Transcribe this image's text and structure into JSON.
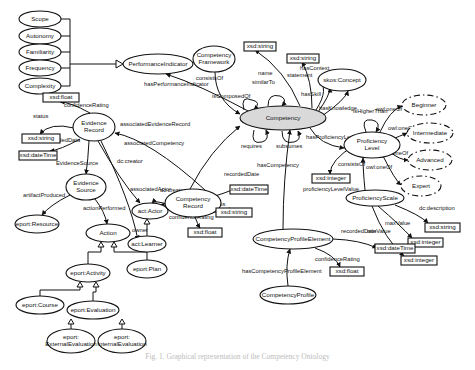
{
  "caption": "Fig. 1. Graphical representation of the Competency Ontology",
  "nodes": [
    {
      "id": "scope",
      "label": "Scope",
      "shape": "ellipse",
      "x": 40,
      "y": 19,
      "rx": 21,
      "ry": 8
    },
    {
      "id": "autonomy",
      "label": "Autonomy",
      "shape": "ellipse",
      "x": 40,
      "y": 36,
      "rx": 21,
      "ry": 8
    },
    {
      "id": "familiarity",
      "label": "Familiarity",
      "shape": "ellipse",
      "x": 40,
      "y": 52,
      "rx": 21,
      "ry": 8
    },
    {
      "id": "frequency",
      "label": "Frequency",
      "shape": "ellipse",
      "x": 40,
      "y": 68,
      "rx": 21,
      "ry": 8
    },
    {
      "id": "complexity",
      "label": "Complexity",
      "shape": "ellipse",
      "x": 40,
      "y": 86,
      "rx": 21,
      "ry": 8
    },
    {
      "id": "perfind",
      "label": "PerformanceIndicator",
      "shape": "ellipse",
      "x": 158,
      "y": 64,
      "rx": 35,
      "ry": 10
    },
    {
      "id": "compframe",
      "label": "Competency|Framework",
      "shape": "ellipse",
      "x": 214,
      "y": 59,
      "rx": 21,
      "ry": 13
    },
    {
      "id": "xsdstr1",
      "label": "xsd:string",
      "shape": "rect",
      "x": 244,
      "y": 42,
      "w": 32,
      "h": 9
    },
    {
      "id": "xsdstr2",
      "label": "xsd:string",
      "shape": "rect",
      "x": 287,
      "y": 54,
      "w": 32,
      "h": 9
    },
    {
      "id": "skos",
      "label": "skos:Concept",
      "shape": "ellipse",
      "x": 342,
      "y": 80,
      "rx": 24,
      "ry": 11
    },
    {
      "id": "competency",
      "label": "Competency",
      "shape": "main",
      "x": 283,
      "y": 118,
      "rx": 43,
      "ry": 12
    },
    {
      "id": "xsdfloat1",
      "label": "xsd:float",
      "shape": "rect",
      "x": 43,
      "y": 93,
      "w": 36,
      "h": 9
    },
    {
      "id": "evrec",
      "label": "Evidence|Record",
      "shape": "ellipse",
      "x": 94,
      "y": 127,
      "rx": 21,
      "ry": 14
    },
    {
      "id": "xsdstr3",
      "label": "xsd:string",
      "shape": "rect",
      "x": 22,
      "y": 134,
      "w": 38,
      "h": 9
    },
    {
      "id": "xsddt1",
      "label": "xsd:dateTime",
      "shape": "rect",
      "x": 19,
      "y": 151,
      "w": 38,
      "h": 9
    },
    {
      "id": "evsrc",
      "label": "Evidence|Source",
      "shape": "ellipse",
      "x": 86,
      "y": 187,
      "rx": 20,
      "ry": 13
    },
    {
      "id": "eportres",
      "label": "eport:Resource",
      "shape": "ellipse",
      "x": 37,
      "y": 224,
      "rx": 22,
      "ry": 9
    },
    {
      "id": "action",
      "label": "Action",
      "shape": "ellipse",
      "x": 108,
      "y": 233,
      "rx": 22,
      "ry": 9
    },
    {
      "id": "actactor",
      "label": "act:Actor",
      "shape": "ellipse",
      "x": 150,
      "y": 211,
      "rx": 18,
      "ry": 8
    },
    {
      "id": "actlearner",
      "label": "act:Learner",
      "shape": "ellipse",
      "x": 147,
      "y": 244,
      "rx": 19,
      "ry": 8
    },
    {
      "id": "comprec",
      "label": "Competency|Record",
      "shape": "ellipse",
      "x": 193,
      "y": 203,
      "rx": 28,
      "ry": 14
    },
    {
      "id": "xsddt2",
      "label": "xsd:dateTime",
      "shape": "rect",
      "x": 230,
      "y": 185,
      "w": 38,
      "h": 9
    },
    {
      "id": "xsdstr4",
      "label": "xsd:string",
      "shape": "rect",
      "x": 216,
      "y": 208,
      "w": 36,
      "h": 9
    },
    {
      "id": "xsdfloat2",
      "label": "xsd:float",
      "shape": "rect",
      "x": 188,
      "y": 228,
      "w": 34,
      "h": 9
    },
    {
      "id": "eportplan",
      "label": "eport:Plan",
      "shape": "ellipse",
      "x": 147,
      "y": 269,
      "rx": 20,
      "ry": 9
    },
    {
      "id": "eportact",
      "label": "eport:Activity",
      "shape": "ellipse",
      "x": 88,
      "y": 273,
      "rx": 22,
      "ry": 9
    },
    {
      "id": "eportcourse",
      "label": "eport:Course",
      "shape": "ellipse",
      "x": 40,
      "y": 305,
      "rx": 24,
      "ry": 9
    },
    {
      "id": "eporteval",
      "label": "eport:Evaluation",
      "shape": "ellipse",
      "x": 93,
      "y": 310,
      "rx": 26,
      "ry": 9
    },
    {
      "id": "eportext",
      "label": "eport:|ExternalEvaluation",
      "shape": "ellipse",
      "x": 71,
      "y": 341,
      "rx": 24,
      "ry": 12
    },
    {
      "id": "eportint",
      "label": "eport:|InternalEvaluation",
      "shape": "ellipse",
      "x": 122,
      "y": 341,
      "rx": 24,
      "ry": 12
    },
    {
      "id": "profLevel",
      "label": "Proficiency|Level",
      "shape": "ellipse",
      "x": 372,
      "y": 145,
      "rx": 28,
      "ry": 13
    },
    {
      "id": "beginner",
      "label": "Beginner",
      "shape": "dashed",
      "x": 424,
      "y": 105,
      "rx": 22,
      "ry": 10
    },
    {
      "id": "intermediate",
      "label": "Intermediate",
      "shape": "dashed",
      "x": 430,
      "y": 133,
      "rx": 23,
      "ry": 10
    },
    {
      "id": "advanced",
      "label": "Advanced",
      "shape": "dashed",
      "x": 430,
      "y": 160,
      "rx": 22,
      "ry": 10
    },
    {
      "id": "expert",
      "label": "Expert",
      "shape": "dashed",
      "x": 421,
      "y": 186,
      "rx": 20,
      "ry": 10
    },
    {
      "id": "xsdint1",
      "label": "xsd:integer",
      "shape": "rect",
      "x": 312,
      "y": 174,
      "w": 38,
      "h": 9
    },
    {
      "id": "profscale",
      "label": "ProficiencyScale",
      "shape": "ellipse",
      "x": 375,
      "y": 198,
      "rx": 29,
      "ry": 8
    },
    {
      "id": "xsdstr5",
      "label": "xsd:string",
      "shape": "rect",
      "x": 425,
      "y": 223,
      "w": 35,
      "h": 9
    },
    {
      "id": "xsdint2",
      "label": "xsd:integer",
      "shape": "rect",
      "x": 408,
      "y": 238,
      "w": 35,
      "h": 9
    },
    {
      "id": "xsdint3",
      "label": "xsd:integer",
      "shape": "rect",
      "x": 401,
      "y": 256,
      "w": 36,
      "h": 9
    },
    {
      "id": "cpe",
      "label": "CompetencyProfileElement",
      "shape": "ellipse",
      "x": 293,
      "y": 239,
      "rx": 40,
      "ry": 10
    },
    {
      "id": "xsddt3",
      "label": "xsd:dateTime",
      "shape": "rect",
      "x": 375,
      "y": 244,
      "w": 40,
      "h": 9
    },
    {
      "id": "xsdfloat3",
      "label": "xsd:float",
      "shape": "rect",
      "x": 330,
      "y": 267,
      "w": 34,
      "h": 9
    },
    {
      "id": "compprofile",
      "label": "CompetencyProfile",
      "shape": "ellipse",
      "x": 288,
      "y": 295,
      "rx": 28,
      "ry": 9
    }
  ],
  "edges": [
    {
      "label": "hasPerformanceIndicator",
      "d": "M250,112 Q200,85 166,74",
      "lx": 144,
      "ly": 86
    },
    {
      "label": "consistsOf",
      "d": "M215,72 Q215,100 240,114",
      "lx": 196,
      "ly": 80
    },
    {
      "label": "isComposedOf",
      "d": "M244,110 Q240,95 252,100 Q262,102 254,110",
      "lx": 212,
      "ly": 98
    },
    {
      "label": "similarTo",
      "d": "M268,106 Q268,93 280,96 Q288,99 282,106",
      "lx": 252,
      "ly": 84
    },
    {
      "label": "name",
      "d": "M300,106 Q285,70 255,50",
      "lx": 258,
      "ly": 75
    },
    {
      "label": "statement",
      "d": "M312,108 Q312,80 302,62",
      "lx": 287,
      "ly": 77
    },
    {
      "label": "hasContext",
      "d": "M316,110 Q330,88 318,80",
      "lx": 300,
      "ly": 70
    },
    {
      "label": "hasSkill",
      "d": "M318,112 Q330,95 330,88",
      "lx": 301,
      "ly": 96
    },
    {
      "label": "hasKnowledge",
      "d": "M322,116 Q345,100 348,91",
      "lx": 319,
      "ly": 110
    },
    {
      "label": "requires",
      "d": "M254,130 Q250,145 262,142 Q270,140 266,130",
      "lx": 241,
      "ly": 148
    },
    {
      "label": "subsumes",
      "d": "M282,131 Q282,145 294,142 Q302,140 298,131",
      "lx": 276,
      "ly": 148
    },
    {
      "label": "hasProficiencyLevel",
      "d": "M310,128 Q320,145 344,148",
      "lx": 306,
      "ly": 139
    },
    {
      "label": "hasCompetency",
      "d": "M283,229 Q283,180 290,130",
      "lx": 257,
      "ly": 167
    },
    {
      "label": "associatedCompetency",
      "d": "M190,189 Q210,150 240,126",
      "lx": 124,
      "ly": 145
    },
    {
      "label": "associatedEvidenceRecord",
      "d": "M205,190 Q150,140 115,133",
      "lx": 120,
      "ly": 126
    },
    {
      "label": "confidenceRating",
      "d": "M90,113 Q70,102 60,102",
      "lx": 64,
      "ly": 107
    },
    {
      "label": "status",
      "d": "M74,128 Q50,122 40,134",
      "lx": 33,
      "ly": 118
    },
    {
      "label": "recordedData",
      "d": "M80,139 Q60,150 50,151",
      "lx": 45,
      "ly": 142
    },
    {
      "label": "EvidenceSource",
      "d": "M89,141 Q88,160 86,174",
      "lx": 56,
      "ly": 165
    },
    {
      "label": "artifactProduced",
      "d": "M70,195 Q50,205 42,215",
      "lx": 23,
      "ly": 197
    },
    {
      "label": "actionPerformed",
      "d": "M95,199 Q105,212 107,224",
      "lx": 83,
      "ly": 210
    },
    {
      "label": "dc:creator",
      "d": "M98,141 Q120,180 140,203",
      "lx": 117,
      "ly": 163
    },
    {
      "label": "associatedActor",
      "d": "M170,205 Q155,200 152,203",
      "lx": 130,
      "ly": 191
    },
    {
      "label": "dc:creator",
      "d": "M173,212 Q163,205 160,205",
      "lx": 160,
      "ly": 192
    },
    {
      "label": "owner",
      "d": "M101,141 Q130,200 138,240",
      "lx": 132,
      "ly": 232
    },
    {
      "label": "recordedDate",
      "d": "M215,196 Q235,190 240,185",
      "lx": 224,
      "ly": 176
    },
    {
      "label": "status",
      "d": "M208,212 Q222,213 230,208",
      "lx": 210,
      "ly": 206
    },
    {
      "label": "confidenceRating",
      "d": "M195,217 Q198,225 200,228",
      "lx": 169,
      "ly": 219
    },
    {
      "label": "isHigherThan",
      "d": "M366,132 Q360,118 372,120 Q382,122 376,132",
      "lx": 353,
      "ly": 113
    },
    {
      "label": "owl:oneOf",
      "d": "M380,132 Q390,110 402,106",
      "lx": 376,
      "ly": 111
    },
    {
      "label": "owl:oneOf",
      "d": "M395,138 Q405,134 407,133",
      "lx": 388,
      "ly": 130
    },
    {
      "label": "owl:oneOf",
      "d": "M390,152 Q400,160 408,160",
      "lx": 382,
      "ly": 155
    },
    {
      "label": "owl:oneOf",
      "d": "M383,156 Q395,180 401,185",
      "lx": 366,
      "ly": 169
    },
    {
      "label": "consistsOf",
      "d": "M365,190 Q363,170 363,158",
      "lx": 338,
      "ly": 166
    },
    {
      "label": "proficiencyLevelValue",
      "d": "M355,145 Q330,160 330,174",
      "lx": 303,
      "ly": 191
    },
    {
      "label": "dc:description",
      "d": "M395,205 Q420,215 428,223",
      "lx": 419,
      "ly": 210
    },
    {
      "label": "maxValue",
      "d": "M378,206 Q400,225 412,238",
      "lx": 385,
      "ly": 225
    },
    {
      "label": "minValue",
      "d": "M372,206 Q385,240 404,256",
      "lx": 367,
      "ly": 233
    },
    {
      "label": "recordedDate",
      "d": "M333,239 Q360,240 377,248",
      "lx": 341,
      "ly": 233
    },
    {
      "label": "confidenceRating",
      "d": "M315,248 Q335,255 340,267",
      "lx": 315,
      "ly": 261
    },
    {
      "label": "hasCompetencyProfileElement",
      "d": "M288,286 Q285,265 290,249",
      "lx": 242,
      "ly": 273
    }
  ],
  "subclass_groups": [
    {
      "parent": "perfind",
      "children": [
        "scope",
        "autonomy",
        "familiarity",
        "frequency",
        "complexity"
      ]
    },
    {
      "parent": "actactor",
      "children": [
        "actlearner"
      ]
    },
    {
      "parent": "action",
      "children": [
        "eportact",
        "eportplan"
      ]
    },
    {
      "parent": "eportact",
      "children": [
        "eportcourse",
        "eporteval"
      ]
    },
    {
      "parent": "eporteval",
      "children": [
        "eportext",
        "eportint"
      ]
    }
  ]
}
